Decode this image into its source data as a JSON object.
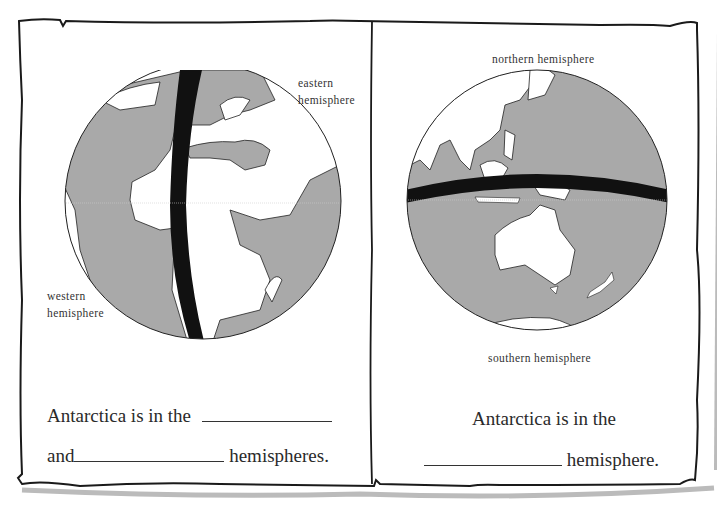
{
  "colors": {
    "ocean_land_gray": "#a9a9a9",
    "line": "#1a1a1a",
    "paper": "#ffffff"
  },
  "left_panel": {
    "globe": {
      "view": "Atlantic / Europe / Africa",
      "divider": "prime meridian (vertical band)"
    },
    "labels": {
      "east": [
        "eastern",
        "hemisphere"
      ],
      "west": [
        "western",
        "hemisphere"
      ]
    },
    "question": {
      "line1_prefix": "Antarctica is in the",
      "line2_prefix": "and",
      "line2_suffix": "hemispheres."
    }
  },
  "right_panel": {
    "globe": {
      "view": "Asia / Australia / Antarctica",
      "divider": "equator (horizontal band)"
    },
    "labels": {
      "north": "northern hemisphere",
      "south": "southern hemisphere"
    },
    "question": {
      "line1": "Antarctica is in the",
      "line2_suffix": "hemisphere."
    }
  }
}
